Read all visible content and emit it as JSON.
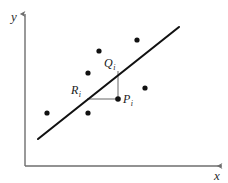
{
  "figure": {
    "background_color": "#ffffff",
    "width": 228,
    "height": 183
  },
  "axes": {
    "color": "#6e6e6e",
    "origin": {
      "x": 25,
      "y": 166
    },
    "y_axis": {
      "label": "y",
      "top": {
        "x": 25,
        "y": 14
      },
      "bottom": {
        "x": 25,
        "y": 166
      },
      "label_pos": {
        "x": 11,
        "y": 21
      }
    },
    "x_axis": {
      "label": "x",
      "left": {
        "x": 25,
        "y": 166
      },
      "right": {
        "x": 222,
        "y": 166
      },
      "label_pos": {
        "x": 214,
        "y": 180
      }
    }
  },
  "regression_line": {
    "name": "regression-line",
    "color": "#111111",
    "width": 2.1,
    "start": {
      "x": 38,
      "y": 139
    },
    "end": {
      "x": 179,
      "y": 27
    }
  },
  "data_points": {
    "color": "#111111",
    "radius": 2.6,
    "items": [
      {
        "name": "data-point-1",
        "x": 47,
        "y": 113
      },
      {
        "name": "data-point-2",
        "x": 88,
        "y": 113
      },
      {
        "name": "data-point-3",
        "x": 88,
        "y": 73
      },
      {
        "name": "data-point-4",
        "x": 99,
        "y": 51
      },
      {
        "name": "data-point-5",
        "x": 137,
        "y": 40
      },
      {
        "name": "data-point-6",
        "x": 145,
        "y": 88
      },
      {
        "name": "data-point-7",
        "x": 118,
        "y": 99
      }
    ]
  },
  "residual_construction": {
    "connector_color": "#8a8a8a",
    "connector_width": 1.3,
    "vertical_segment": {
      "name": "segment-pi-qi",
      "from": {
        "x": 118,
        "y": 99
      },
      "to": {
        "x": 118,
        "y": 71
      }
    },
    "horizontal_segment": {
      "name": "segment-ri-pi",
      "from": {
        "x": 87,
        "y": 99
      },
      "to": {
        "x": 118,
        "y": 99
      }
    }
  },
  "labels": {
    "p_i": {
      "base": "P",
      "sub": "i",
      "x": 123,
      "y": 103
    },
    "q_i": {
      "base": "Q",
      "sub": "i",
      "x": 104,
      "y": 67
    },
    "r_i": {
      "base": "R",
      "sub": "i",
      "x": 71,
      "y": 94
    }
  }
}
